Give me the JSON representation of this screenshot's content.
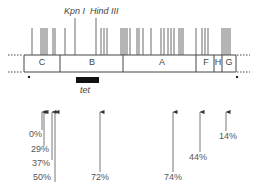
{
  "figure": {
    "type": "restriction map",
    "enzymes": {
      "kpn": "Kpn I",
      "hind": "Hind III"
    },
    "fragments": [
      {
        "label": "C",
        "x": 42
      },
      {
        "label": "B",
        "x": 92
      },
      {
        "label": "A",
        "x": 162
      },
      {
        "label": "F",
        "x": 206
      },
      {
        "label": "H",
        "x": 218
      },
      {
        "label": "G",
        "x": 229
      }
    ],
    "gene": {
      "label": "tet"
    },
    "markers": [
      "*",
      "*"
    ],
    "arrows": [
      {
        "label": "0%",
        "x": 42,
        "label_x": 29,
        "label_y": 134
      },
      {
        "label": "29%",
        "x": 44,
        "label_x": 31,
        "label_y": 149
      },
      {
        "label": "37%",
        "x": 52,
        "label_x": 32,
        "label_y": 163
      },
      {
        "label": "50%",
        "x": 55,
        "label_x": 33,
        "label_y": 177
      },
      {
        "label": "72%",
        "x": 100,
        "label_x": 91,
        "label_y": 177
      },
      {
        "label": "74%",
        "x": 173,
        "label_x": 164,
        "label_y": 177
      },
      {
        "label": "44%",
        "x": 200,
        "label_x": 189,
        "label_y": 156
      },
      {
        "label": "14%",
        "x": 226,
        "label_x": 219,
        "label_y": 136
      }
    ]
  }
}
